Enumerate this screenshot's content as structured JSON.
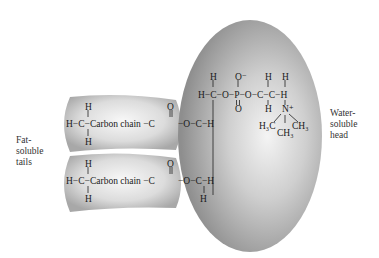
{
  "diagram": {
    "type": "phospholipid-structure",
    "labels": {
      "tails": [
        "Fat-",
        "soluble",
        "tails"
      ],
      "head": [
        "Water-",
        "soluble",
        "head"
      ]
    },
    "tail_text": "Carbon chain",
    "atoms": {
      "H": "H",
      "C": "C",
      "O": "O",
      "P": "P",
      "N": "N",
      "O_minus": "O⁻",
      "N_plus_sup": "+",
      "H3C": "H₃C",
      "CH3": "CH₃"
    },
    "colors": {
      "head_fill": "#9a9a9a",
      "head_highlight": "#f2f2f2",
      "tail_fill": "#b8b8b8",
      "tail_highlight": "#f5f5f5",
      "text": "#1a1a1a"
    }
  }
}
